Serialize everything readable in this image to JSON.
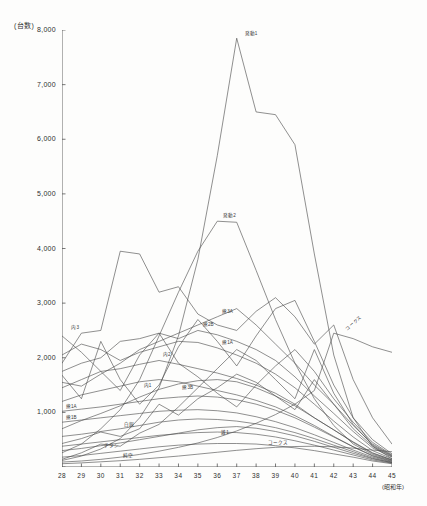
{
  "chart_data": {
    "type": "line",
    "title": "",
    "unit_label": "(台数)",
    "xlabel": "(昭和年)",
    "ylabel": "",
    "grid": false,
    "legend": "inline-labels",
    "xlim": [
      28,
      45
    ],
    "ylim": [
      0,
      8000
    ],
    "yticks": [
      0,
      1000,
      2000,
      3000,
      4000,
      5000,
      6000,
      7000,
      8000
    ],
    "ytick_labels": [
      "",
      "1,000",
      "2,000",
      "3,000",
      "4,000",
      "5,000",
      "6,000",
      "7,000",
      "8,000"
    ],
    "categories": [
      28,
      29,
      30,
      31,
      32,
      33,
      34,
      35,
      36,
      37,
      38,
      39,
      40,
      41,
      42,
      43,
      44,
      45
    ],
    "xtick_labels": [
      "28",
      "29",
      "30",
      "31",
      "32",
      "33",
      "34",
      "35",
      "36",
      "37",
      "38",
      "39",
      "40",
      "41",
      "42",
      "43",
      "44",
      "45"
    ],
    "series": [
      {
        "name": "発動1",
        "label": "発動1",
        "label_at": 37,
        "label_dx": 8,
        "label_dy": -3,
        "values": [
          120,
          200,
          330,
          520,
          900,
          1450,
          2400,
          3800,
          5700,
          7850,
          6500,
          6450,
          5900,
          3900,
          2050,
          900,
          380,
          150
        ]
      },
      {
        "name": "発動2",
        "label": "発動2",
        "label_at": 36,
        "label_dx": 6,
        "label_dy": -4,
        "values": [
          260,
          420,
          700,
          1050,
          1600,
          2400,
          3200,
          3950,
          4500,
          4480,
          3600,
          2700,
          1900,
          1250,
          760,
          420,
          230,
          120
        ]
      },
      {
        "name": "内3",
        "label": "内3",
        "label_at": 29,
        "label_dx": -10,
        "label_dy": -4,
        "values": [
          1900,
          2450,
          2500,
          3950,
          3900,
          3200,
          3300,
          2800,
          2600,
          2500,
          2850,
          3100,
          2750,
          2250,
          2600,
          1600,
          900,
          420
        ]
      },
      {
        "name": "熊3A",
        "label": "熊3A",
        "label_at": 36,
        "label_dx": 5,
        "label_dy": -4,
        "values": [
          1550,
          1480,
          1700,
          1900,
          2150,
          2300,
          2450,
          2600,
          2750,
          2900,
          2600,
          2250,
          1900,
          1500,
          1150,
          760,
          420,
          210
        ]
      },
      {
        "name": "熊2B",
        "label": "熊2B",
        "label_at": 35,
        "label_dx": 5,
        "label_dy": -4,
        "values": [
          1750,
          1900,
          2000,
          2300,
          2350,
          2450,
          2350,
          2500,
          2420,
          2300,
          2150,
          1950,
          1650,
          1300,
          980,
          650,
          350,
          180
        ]
      },
      {
        "name": "熊1A",
        "label": "熊1A",
        "label_at": 36,
        "label_dx": 5,
        "label_dy": -4,
        "values": [
          2050,
          2250,
          2150,
          1950,
          2100,
          2200,
          2300,
          2280,
          2180,
          2050,
          1900,
          1700,
          1450,
          1150,
          840,
          550,
          300,
          150
        ]
      },
      {
        "name": "内2",
        "label": "内2",
        "label_at": 33,
        "label_dx": 4,
        "label_dy": -4,
        "values": [
          1450,
          1600,
          1750,
          1800,
          1880,
          1950,
          1880,
          1800,
          1720,
          1620,
          1500,
          1350,
          1150,
          900,
          680,
          450,
          250,
          130
        ]
      },
      {
        "name": "内1",
        "label": "内1",
        "label_at": 32,
        "label_dx": 4,
        "label_dy": 5,
        "values": [
          1200,
          1320,
          1400,
          1480,
          1560,
          1600,
          1560,
          1480,
          1400,
          1320,
          1220,
          1100,
          940,
          760,
          560,
          370,
          200,
          100
        ]
      },
      {
        "name": "熊3B",
        "label": "熊3B",
        "label_at": 34,
        "label_dx": 4,
        "label_dy": 5,
        "values": [
          700,
          850,
          980,
          1120,
          1280,
          1420,
          1520,
          1580,
          1600,
          1560,
          1450,
          1300,
          1120,
          900,
          680,
          460,
          260,
          130
        ]
      },
      {
        "name": "熊1A下",
        "label": "熊1A",
        "label_at": 28,
        "label_dx": 4,
        "label_dy": -3,
        "values": [
          1020,
          1060,
          1100,
          1150,
          1200,
          1250,
          1280,
          1300,
          1280,
          1230,
          1150,
          1040,
          900,
          730,
          550,
          370,
          210,
          110
        ]
      },
      {
        "name": "熊1B",
        "label": "熊1B",
        "label_at": 28,
        "label_dx": 4,
        "label_dy": -3,
        "values": [
          820,
          860,
          900,
          940,
          980,
          1020,
          1040,
          1050,
          1030,
          990,
          920,
          830,
          720,
          590,
          450,
          310,
          180,
          90
        ]
      },
      {
        "name": "白銅",
        "label": "白銅",
        "label_at": 31,
        "label_dx": 4,
        "label_dy": -3,
        "values": [
          560,
          600,
          650,
          700,
          760,
          820,
          860,
          880,
          870,
          840,
          790,
          720,
          630,
          520,
          400,
          280,
          160,
          80
        ]
      },
      {
        "name": "チタン",
        "label": "チタン",
        "label_at": 30,
        "label_dx": 3,
        "label_dy": 5,
        "values": [
          380,
          420,
          460,
          500,
          540,
          580,
          610,
          630,
          640,
          630,
          600,
          550,
          480,
          400,
          310,
          220,
          130,
          70
        ]
      },
      {
        "name": "純空",
        "label": "純空",
        "label_at": 31,
        "label_dx": 3,
        "label_dy": 6,
        "values": [
          180,
          210,
          250,
          290,
          330,
          370,
          400,
          420,
          430,
          430,
          420,
          390,
          350,
          300,
          240,
          180,
          110,
          60
        ]
      },
      {
        "name": "コークス上",
        "label": "コークス",
        "label_at": 43,
        "label_dx": -6,
        "label_dy": -8,
        "rotated": true,
        "values": [
          90,
          110,
          140,
          180,
          230,
          290,
          360,
          440,
          540,
          660,
          800,
          960,
          1150,
          1400,
          2450,
          2350,
          2200,
          2100
        ]
      },
      {
        "name": "コークス下",
        "label": "コークス",
        "label_at": 39,
        "label_dx": -8,
        "label_dy": -3,
        "values": [
          60,
          75,
          95,
          115,
          140,
          170,
          200,
          235,
          270,
          305,
          335,
          360,
          375,
          380,
          370,
          345,
          310,
          280
        ]
      },
      {
        "name": "雑1",
        "label": "雑1",
        "label_at": 36,
        "label_dx": 4,
        "label_dy": 6,
        "values": [
          300,
          340,
          390,
          440,
          500,
          560,
          620,
          680,
          720,
          740,
          710,
          650,
          570,
          470,
          360,
          250,
          150,
          80
        ]
      },
      {
        "name": "雑2",
        "label": "",
        "label_at": 0,
        "label_dx": 0,
        "label_dy": 0,
        "values": [
          430,
          520,
          640,
          560,
          700,
          1150,
          950,
          1250,
          1450,
          1700,
          1550,
          1300,
          1050,
          1600,
          1150,
          700,
          380,
          190
        ]
      },
      {
        "name": "雑3",
        "label": "",
        "label_at": 0,
        "label_dx": 0,
        "label_dy": 0,
        "values": [
          2400,
          2100,
          1750,
          1400,
          2050,
          2450,
          1900,
          1650,
          1350,
          1100,
          1500,
          1850,
          2150,
          1750,
          1250,
          820,
          450,
          220
        ]
      },
      {
        "name": "雑4",
        "label": "",
        "label_at": 0,
        "label_dx": 0,
        "label_dy": 0,
        "values": [
          1680,
          1250,
          2300,
          1600,
          1150,
          1500,
          2200,
          2700,
          2300,
          1850,
          2400,
          2900,
          3050,
          2300,
          1500,
          900,
          500,
          240
        ]
      },
      {
        "name": "雑5",
        "label": "",
        "label_at": 0,
        "label_dx": 0,
        "label_dy": 0,
        "values": [
          140,
          260,
          420,
          380,
          620,
          780,
          1100,
          1450,
          1800,
          2150,
          1950,
          1600,
          1250,
          2150,
          1350,
          780,
          400,
          200
        ]
      }
    ]
  }
}
